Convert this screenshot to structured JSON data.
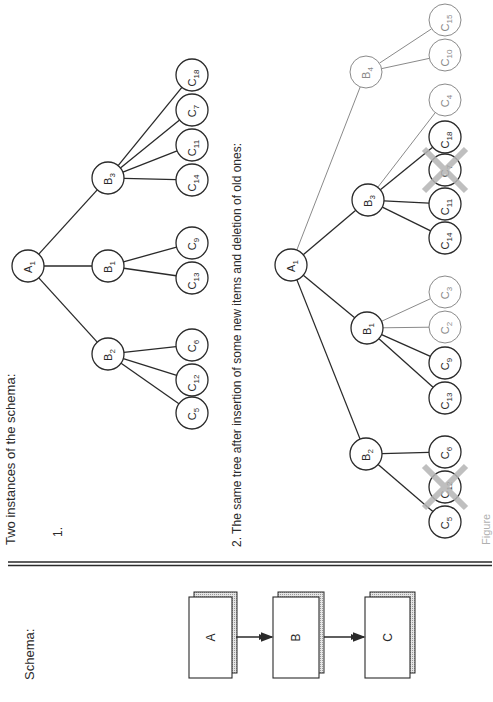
{
  "header": {
    "schema_label": "Schema:",
    "instances_label": "Two instances of the schema:",
    "instance1_label": "1.",
    "instance2_label": "2.  The same tree after insertion of some new items and deletion of old ones:",
    "caption_partial": "Figure"
  },
  "colors": {
    "ink": "#2a2a2a",
    "new_item": "#8a8a8a",
    "deleted_cross": "#b5b5b5",
    "shadow": "#d8d8d8"
  },
  "schema": {
    "boxes": [
      {
        "id": "A",
        "label": "A",
        "x": 189,
        "y": 597,
        "w": 43,
        "h": 81
      },
      {
        "id": "B",
        "label": "B",
        "x": 273,
        "y": 597,
        "w": 46,
        "h": 81
      },
      {
        "id": "C",
        "label": "C",
        "x": 365,
        "y": 597,
        "w": 45,
        "h": 81
      }
    ],
    "arrows": [
      {
        "from": "A",
        "to": "B",
        "x1": 236,
        "x2": 272,
        "y": 637
      },
      {
        "from": "B",
        "to": "C",
        "x1": 324,
        "x2": 364,
        "y": 637
      }
    ]
  },
  "tree1": {
    "nodes": [
      {
        "id": "A1",
        "base": "A",
        "sub": "1",
        "x": 28,
        "y": 266,
        "state": "normal"
      },
      {
        "id": "B3",
        "base": "B",
        "sub": "3",
        "x": 108,
        "y": 178,
        "state": "normal"
      },
      {
        "id": "B1",
        "base": "B",
        "sub": "1",
        "x": 108,
        "y": 266,
        "state": "normal"
      },
      {
        "id": "B2",
        "base": "B",
        "sub": "2",
        "x": 108,
        "y": 354,
        "state": "normal"
      },
      {
        "id": "C18",
        "base": "C",
        "sub": "18",
        "x": 192,
        "y": 75,
        "state": "normal"
      },
      {
        "id": "C7",
        "base": "C",
        "sub": "7",
        "x": 192,
        "y": 110,
        "state": "normal"
      },
      {
        "id": "C11",
        "base": "C",
        "sub": "11",
        "x": 192,
        "y": 145,
        "state": "normal"
      },
      {
        "id": "C14",
        "base": "C",
        "sub": "14",
        "x": 192,
        "y": 180,
        "state": "normal"
      },
      {
        "id": "C9",
        "base": "C",
        "sub": "9",
        "x": 192,
        "y": 243,
        "state": "normal"
      },
      {
        "id": "C13",
        "base": "C",
        "sub": "13",
        "x": 192,
        "y": 278,
        "state": "normal"
      },
      {
        "id": "C6",
        "base": "C",
        "sub": "6",
        "x": 192,
        "y": 345,
        "state": "normal"
      },
      {
        "id": "C12",
        "base": "C",
        "sub": "12",
        "x": 192,
        "y": 380,
        "state": "normal"
      },
      {
        "id": "C5",
        "base": "C",
        "sub": "5",
        "x": 192,
        "y": 413,
        "state": "normal"
      }
    ],
    "edges": [
      [
        "A1",
        "B3",
        "normal"
      ],
      [
        "A1",
        "B1",
        "normal"
      ],
      [
        "A1",
        "B2",
        "normal"
      ],
      [
        "B3",
        "C18",
        "normal"
      ],
      [
        "B3",
        "C7",
        "normal"
      ],
      [
        "B3",
        "C11",
        "normal"
      ],
      [
        "B3",
        "C14",
        "normal"
      ],
      [
        "B1",
        "C9",
        "normal"
      ],
      [
        "B1",
        "C13",
        "normal"
      ],
      [
        "B2",
        "C6",
        "normal"
      ],
      [
        "B2",
        "C12",
        "normal"
      ],
      [
        "B2",
        "C5",
        "normal"
      ]
    ]
  },
  "tree2": {
    "nodes": [
      {
        "id": "A1",
        "base": "A",
        "sub": "1",
        "x": 291,
        "y": 265,
        "state": "normal"
      },
      {
        "id": "B4",
        "base": "B",
        "sub": "4",
        "x": 366,
        "y": 72,
        "state": "new"
      },
      {
        "id": "B3",
        "base": "B",
        "sub": "3",
        "x": 368,
        "y": 200,
        "state": "normal"
      },
      {
        "id": "B1",
        "base": "B",
        "sub": "1",
        "x": 367,
        "y": 328,
        "state": "normal"
      },
      {
        "id": "B2",
        "base": "B",
        "sub": "2",
        "x": 366,
        "y": 454,
        "state": "normal"
      },
      {
        "id": "C15",
        "base": "C",
        "sub": "15",
        "x": 445,
        "y": 20,
        "state": "new"
      },
      {
        "id": "C10",
        "base": "C",
        "sub": "10",
        "x": 445,
        "y": 55,
        "state": "new"
      },
      {
        "id": "C4",
        "base": "C",
        "sub": "4",
        "x": 445,
        "y": 100,
        "state": "new"
      },
      {
        "id": "C18",
        "base": "C",
        "sub": "18",
        "x": 445,
        "y": 137,
        "state": "normal"
      },
      {
        "id": "C7",
        "base": "C",
        "sub": "7",
        "x": 445,
        "y": 170,
        "state": "deleted"
      },
      {
        "id": "C11",
        "base": "C",
        "sub": "11",
        "x": 445,
        "y": 204,
        "state": "normal"
      },
      {
        "id": "C14",
        "base": "C",
        "sub": "14",
        "x": 445,
        "y": 238,
        "state": "normal"
      },
      {
        "id": "C3",
        "base": "C",
        "sub": "3",
        "x": 445,
        "y": 292,
        "state": "new"
      },
      {
        "id": "C2",
        "base": "C",
        "sub": "2",
        "x": 445,
        "y": 327,
        "state": "new"
      },
      {
        "id": "C9",
        "base": "C",
        "sub": "9",
        "x": 445,
        "y": 363,
        "state": "normal"
      },
      {
        "id": "C13",
        "base": "C",
        "sub": "13",
        "x": 445,
        "y": 398,
        "state": "normal"
      },
      {
        "id": "C6",
        "base": "C",
        "sub": "6",
        "x": 445,
        "y": 452,
        "state": "normal"
      },
      {
        "id": "C12",
        "base": "C",
        "sub": "12",
        "x": 445,
        "y": 487,
        "state": "deleted"
      },
      {
        "id": "C5",
        "base": "C",
        "sub": "5",
        "x": 445,
        "y": 522,
        "state": "normal"
      }
    ],
    "edges": [
      [
        "A1",
        "B4",
        "new"
      ],
      [
        "A1",
        "B3",
        "normal"
      ],
      [
        "A1",
        "B1",
        "normal"
      ],
      [
        "A1",
        "B2",
        "normal"
      ],
      [
        "B4",
        "C15",
        "new"
      ],
      [
        "B4",
        "C10",
        "new"
      ],
      [
        "B3",
        "C4",
        "new"
      ],
      [
        "B3",
        "C18",
        "normal"
      ],
      [
        "B3",
        "C11",
        "normal"
      ],
      [
        "B3",
        "C14",
        "normal"
      ],
      [
        "B1",
        "C3",
        "new"
      ],
      [
        "B1",
        "C2",
        "new"
      ],
      [
        "B1",
        "C9",
        "normal"
      ],
      [
        "B1",
        "C13",
        "normal"
      ],
      [
        "B2",
        "C6",
        "normal"
      ],
      [
        "B2",
        "C5",
        "normal"
      ]
    ]
  }
}
